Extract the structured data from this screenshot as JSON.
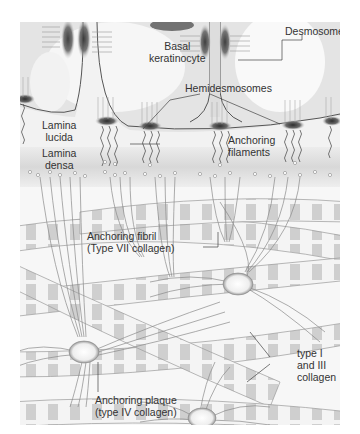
{
  "diagram": {
    "labels": {
      "basal_keratinocyte": [
        "Basal",
        "keratinocyte"
      ],
      "desmosome": "Desmosome",
      "hemidesmosomes": "Hemidesmosomes",
      "anchoring_filaments": [
        "Anchoring",
        "filaments"
      ],
      "lamina_lucida": [
        "Lamina",
        "lucida"
      ],
      "lamina_densa": [
        "Lamina",
        "densa"
      ],
      "anchoring_fibril": [
        "Anchoring fibril",
        "(Type VII collagen)"
      ],
      "type_collagen": [
        "type I",
        "and III",
        "collagen"
      ],
      "anchoring_plaque": [
        "Anchoring plaque",
        "(type IV collagen)"
      ]
    },
    "colors": {
      "background": "#f7f7f7",
      "cell": "#e6e6e6",
      "membrane_line": "#555555",
      "lamina_densa_band": "#dcdcdc",
      "plaque_dark": "#3a3a3a",
      "fibril": "#8a8a8a",
      "collagen_band": "#c8c8c8"
    }
  }
}
